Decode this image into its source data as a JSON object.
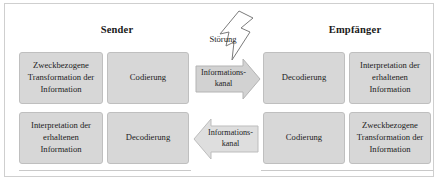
{
  "diagram": {
    "title_sender": "Sender",
    "title_empfaenger": "Empfänger",
    "noise": {
      "label": "Störung",
      "icon": "lightning-bolt-arrow-icon"
    },
    "sender_row": [
      {
        "label": "Zweckbezogene Transformation der Information"
      },
      {
        "label": "Codierung"
      }
    ],
    "receiver_row": [
      {
        "label": "Decodierung"
      },
      {
        "label": "Interpretation der erhaltenen Information"
      }
    ],
    "sender_row_bottom": [
      {
        "label": "Interpretation der erhaltenen Information"
      },
      {
        "label": "Decodierung"
      }
    ],
    "receiver_row_bottom": [
      {
        "label": "Codierung"
      },
      {
        "label": "Zweckbezogene Transformation der Information"
      }
    ],
    "channels": {
      "top": {
        "label_line1": "Informations-",
        "label_line2": "kanal",
        "direction": "right"
      },
      "bottom": {
        "label_line1": "Informations-",
        "label_line2": "kanal",
        "direction": "left"
      }
    },
    "colors": {
      "box_fill": "#d7d7d7",
      "box_border": "#bfbfbf",
      "frame_border": "#cfcfcf",
      "arrow_fill_top": "#d2d2d2",
      "arrow_fill_bottom": "#dedede",
      "text": "#222222"
    }
  }
}
